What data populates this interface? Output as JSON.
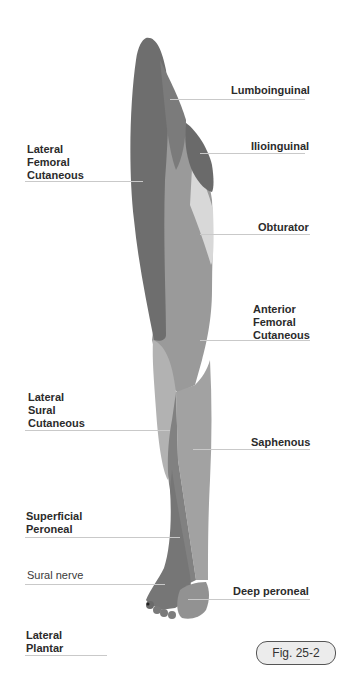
{
  "diagram": {
    "figure_label": "Fig. 25-2",
    "colors": {
      "lateral_femoral_cutaneous": "#6e6e6e",
      "lumboinguinal": "#7b7b7b",
      "ilioinguinal": "#6a6a6a",
      "obturator": "#d8d8d8",
      "anterior_femoral_cutaneous": "#9a9a9a",
      "lateral_sural_cutaneous": "#b2b2b2",
      "saphenous": "#a2a2a2",
      "superficial_peroneal": "#818181",
      "sural": "#767676",
      "deep_peroneal": "#929292"
    },
    "labels_left": [
      {
        "lines": [
          "Lateral",
          "Femoral",
          "Cutaneous"
        ]
      },
      {
        "lines": [
          "Lateral",
          "Sural",
          "Cutaneous"
        ]
      },
      {
        "lines": [
          "Superficial",
          "Peroneal"
        ]
      },
      {
        "lines": [
          "Sural nerve"
        ]
      },
      {
        "lines": [
          "Lateral",
          "Plantar"
        ]
      }
    ],
    "labels_right": [
      {
        "lines": [
          "Lumboinguinal"
        ]
      },
      {
        "lines": [
          "Ilioinguinal"
        ]
      },
      {
        "lines": [
          "Obturator"
        ]
      },
      {
        "lines": [
          "Anterior",
          "Femoral",
          "Cutaneous"
        ]
      },
      {
        "lines": [
          "Saphenous"
        ]
      },
      {
        "lines": [
          "Deep peroneal"
        ]
      }
    ]
  }
}
